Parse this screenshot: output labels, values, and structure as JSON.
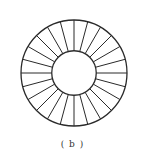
{
  "diagram": {
    "spoke_count": 24,
    "spoke_angle_step_deg": 15,
    "inner_to_outer_radius_ratio": 0.42,
    "stroke_color": "#2a2a2a",
    "background_color": "#ffffff"
  },
  "caption": {
    "text": "( b )"
  }
}
